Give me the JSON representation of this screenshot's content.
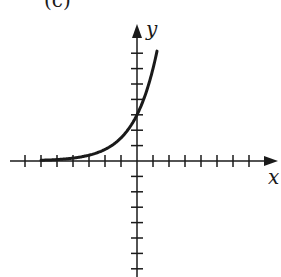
{
  "panel_label": "(c)",
  "chart_data": {
    "type": "line",
    "title": "",
    "xlabel": "x",
    "ylabel": "y",
    "function": "exponential growth, y = 3·2^x",
    "y_intercept": 3,
    "xlim": [
      -7.5,
      8.5
    ],
    "ylim": [
      -7,
      9
    ],
    "x_ticks": [
      -7,
      -6,
      -5,
      -4,
      -3,
      -2,
      -1,
      1,
      2,
      3,
      4,
      5,
      6,
      7
    ],
    "y_ticks": [
      -7,
      -6,
      -5,
      -4,
      -3,
      -2,
      -1,
      1,
      2,
      3,
      4,
      5,
      6,
      7
    ],
    "tick_labels": "none",
    "grid": false,
    "legend": "none",
    "series": [
      {
        "name": "curve",
        "x": [
          -6,
          -5,
          -4,
          -3,
          -2,
          -1,
          0,
          0.5,
          1,
          1.25
        ],
        "y": [
          0.05,
          0.09,
          0.19,
          0.38,
          0.75,
          1.5,
          3,
          4.24,
          6,
          7.1
        ]
      }
    ],
    "color": "#1a1a1a"
  }
}
